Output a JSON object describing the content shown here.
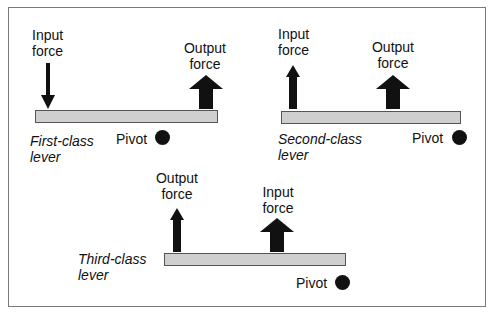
{
  "diagram": {
    "levers": [
      {
        "name": "first-class",
        "label_line1": "First-class",
        "label_line2": "lever",
        "input_force": {
          "line1": "Input",
          "line2": "force",
          "direction": "down"
        },
        "output_force": {
          "line1": "Output",
          "line2": "force",
          "direction": "up"
        },
        "pivot": "Pivot"
      },
      {
        "name": "second-class",
        "label_line1": "Second-class",
        "label_line2": "lever",
        "input_force": {
          "line1": "Input",
          "line2": "force",
          "direction": "up"
        },
        "output_force": {
          "line1": "Output",
          "line2": "force",
          "direction": "up"
        },
        "pivot": "Pivot"
      },
      {
        "name": "third-class",
        "label_line1": "Third-class",
        "label_line2": "lever",
        "input_force": {
          "line1": "Input",
          "line2": "force",
          "direction": "up"
        },
        "output_force": {
          "line1": "Output",
          "line2": "force",
          "direction": "up"
        },
        "pivot": "Pivot"
      }
    ],
    "colors": {
      "bar_fill": "#cfcfcf",
      "bar_border": "#555555",
      "arrow": "#111111",
      "frame": "#7a7a7a"
    }
  }
}
